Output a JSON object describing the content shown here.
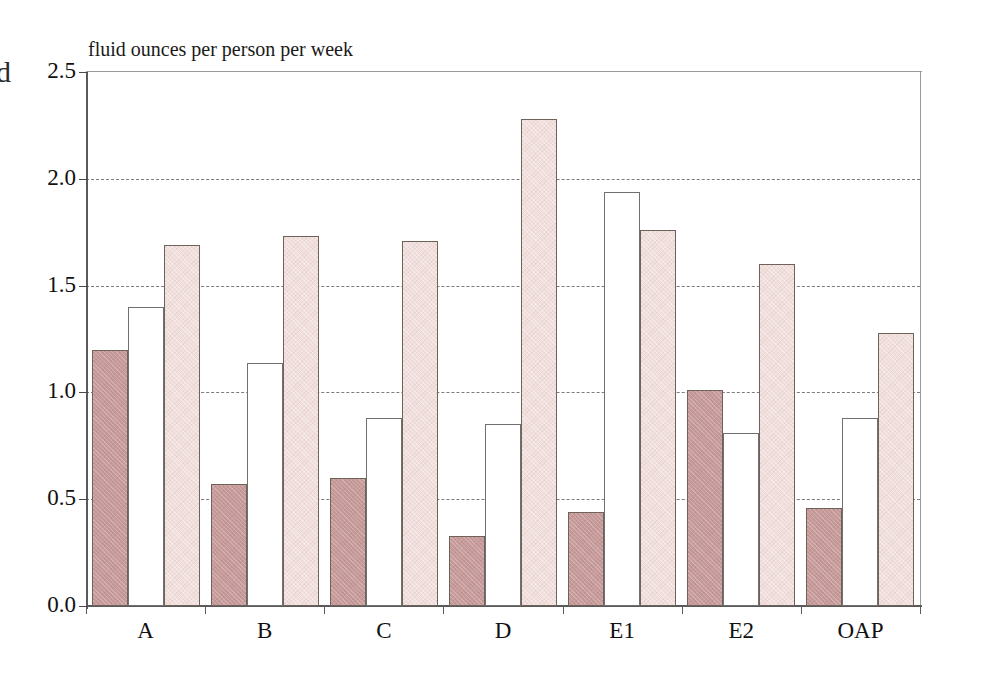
{
  "figure": {
    "edge_mark": "d",
    "axis_title": "fluid ounces per person per week"
  },
  "chart_data": {
    "type": "bar",
    "title": "",
    "subtitle": "",
    "xlabel": "",
    "ylabel": "fluid ounces per person per week",
    "ylim": [
      0.0,
      2.5
    ],
    "ytick_labels": [
      "0.0",
      "0.5",
      "1.0",
      "1.5",
      "2.0",
      "2.5"
    ],
    "ytick_values": [
      0.0,
      0.5,
      1.0,
      1.5,
      2.0,
      2.5
    ],
    "grid": "horizontal-dashed",
    "legend": "none",
    "categories": [
      "A",
      "B",
      "C",
      "D",
      "E1",
      "E2",
      "OAP"
    ],
    "series": [
      {
        "name": "series-1",
        "fill": "#c79a9a",
        "values": [
          1.2,
          0.57,
          0.6,
          0.33,
          0.44,
          1.01,
          0.46
        ]
      },
      {
        "name": "series-2",
        "fill": "#ffffff",
        "values": [
          1.4,
          1.14,
          0.88,
          0.85,
          1.94,
          0.81,
          0.88
        ]
      },
      {
        "name": "series-3",
        "fill": "#f1dfdd",
        "values": [
          1.69,
          1.73,
          1.71,
          2.28,
          1.76,
          1.6,
          1.28
        ]
      }
    ]
  }
}
